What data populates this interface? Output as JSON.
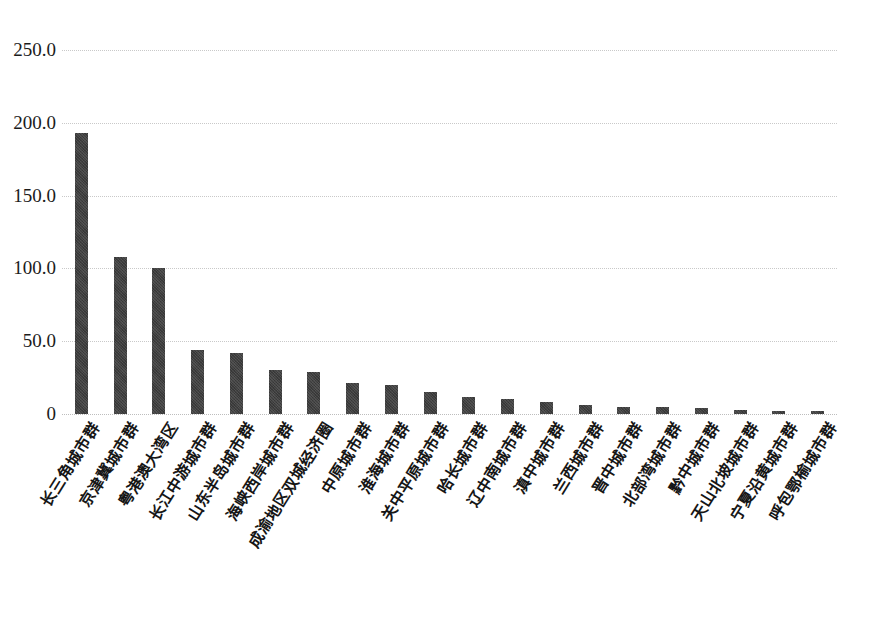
{
  "chart_data": {
    "type": "bar",
    "title": "",
    "subtitle": "",
    "xlabel": "",
    "ylabel": "",
    "ylim": [
      0,
      250
    ],
    "grid": true,
    "legend": false,
    "bar_color": "#3f3f3f",
    "gridline_color": "#c9c9c9",
    "y_ticks": [
      "0",
      "50.0",
      "100.0",
      "150.0",
      "200.0",
      "250.0"
    ],
    "y_tick_values": [
      0,
      50,
      100,
      150,
      200,
      250
    ],
    "categories": [
      "长三角城市群",
      "京津冀城市群",
      "粤港澳大湾区",
      "长江中游城市群",
      "山东半岛城市群",
      "海峡西岸城市群",
      "成渝地区双城经济圈",
      "中原城市群",
      "淮海城市群",
      "关中平原城市群",
      "哈长城市群",
      "辽中南城市群",
      "滇中城市群",
      "兰西城市群",
      "晋中城市群",
      "北部湾城市群",
      "黔中城市群",
      "天山北坡城市群",
      "宁夏沿黄城市群",
      "呼包鄂榆城市群"
    ],
    "values": [
      193,
      108,
      100,
      44,
      42,
      30,
      29,
      21,
      20,
      15,
      12,
      10,
      8,
      6,
      5,
      5,
      4,
      3,
      2,
      2
    ]
  }
}
